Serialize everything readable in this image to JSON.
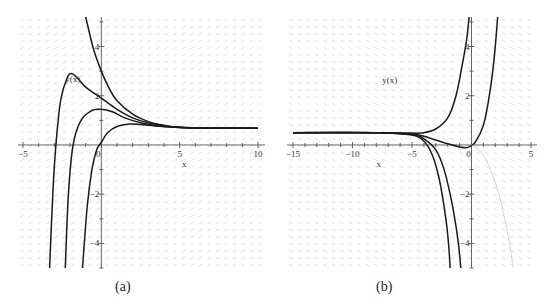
{
  "captions": {
    "a": "(a)",
    "b": "(b)"
  },
  "colors": {
    "curve": "#1a1a1a",
    "axis": "#555555",
    "field": "#d9d9d9",
    "faint_curve": "#c8c8c8"
  },
  "chart_data": [
    {
      "type": "line",
      "title": "",
      "panel": "(a)",
      "xlabel": "x",
      "ylabel": "y(x)",
      "xlim": [
        -5.5,
        10.5
      ],
      "ylim": [
        -5,
        5.2
      ],
      "xticks": [
        -5,
        0,
        5,
        10
      ],
      "xtick_labels": [
        "−5",
        "0",
        "5",
        "10"
      ],
      "yticks": [
        -4,
        -2,
        2,
        4
      ],
      "ytick_labels": [
        "−4",
        "−2",
        "2",
        "4"
      ],
      "grid": false,
      "background": "direction field",
      "series": [
        {
          "name": "solution 1",
          "points": [
            [
              -1.0,
              5.2
            ],
            [
              -0.5,
              3.9
            ],
            [
              0,
              3.0
            ],
            [
              0.5,
              2.3
            ],
            [
              1,
              1.8
            ],
            [
              2,
              1.25
            ],
            [
              3,
              0.95
            ],
            [
              4,
              0.8
            ],
            [
              5,
              0.72
            ],
            [
              7,
              0.69
            ],
            [
              10,
              0.68
            ]
          ]
        },
        {
          "name": "solution 2",
          "points": [
            [
              -3.3,
              -5
            ],
            [
              -3.1,
              -2
            ],
            [
              -2.9,
              0
            ],
            [
              -2.6,
              1.8
            ],
            [
              -2.2,
              2.7
            ],
            [
              -1.9,
              2.9
            ],
            [
              -1.5,
              2.7
            ],
            [
              -1,
              2.35
            ],
            [
              0,
              1.9
            ],
            [
              1,
              1.45
            ],
            [
              2,
              1.1
            ],
            [
              3,
              0.9
            ],
            [
              4,
              0.78
            ],
            [
              5,
              0.72
            ],
            [
              7,
              0.69
            ],
            [
              10,
              0.68
            ]
          ]
        },
        {
          "name": "solution 3",
          "points": [
            [
              -2.3,
              -5
            ],
            [
              -2.1,
              -2
            ],
            [
              -1.8,
              0
            ],
            [
              -1.3,
              1.0
            ],
            [
              -0.6,
              1.4
            ],
            [
              0,
              1.45
            ],
            [
              0.7,
              1.35
            ],
            [
              1.5,
              1.1
            ],
            [
              2.5,
              0.9
            ],
            [
              3.5,
              0.78
            ],
            [
              5,
              0.71
            ],
            [
              7,
              0.69
            ],
            [
              10,
              0.68
            ]
          ]
        },
        {
          "name": "solution 4",
          "points": [
            [
              -1.2,
              -5
            ],
            [
              -0.9,
              -2.5
            ],
            [
              -0.6,
              -1
            ],
            [
              -0.3,
              -0.2
            ],
            [
              0,
              0.1
            ],
            [
              0.4,
              0.5
            ],
            [
              1,
              0.75
            ],
            [
              1.8,
              0.85
            ],
            [
              2.5,
              0.83
            ],
            [
              3.5,
              0.77
            ],
            [
              5,
              0.71
            ],
            [
              7,
              0.69
            ],
            [
              10,
              0.68
            ]
          ]
        }
      ],
      "annotations": [
        {
          "text": "y(x)",
          "x": -2.3,
          "y": 2.55
        }
      ]
    },
    {
      "type": "line",
      "title": "",
      "panel": "(b)",
      "xlabel": "x",
      "ylabel": "y(x)",
      "xlim": [
        -15.5,
        5.5
      ],
      "ylim": [
        -5,
        5.2
      ],
      "xticks": [
        -15,
        -10,
        -5,
        0,
        5
      ],
      "xtick_labels": [
        "−15",
        "−10",
        "−5",
        "0",
        "5"
      ],
      "yticks": [
        -4,
        -2,
        2,
        4
      ],
      "ytick_labels": [
        "−4",
        "−2",
        "2",
        "4"
      ],
      "grid": false,
      "background": "direction field",
      "series": [
        {
          "name": "solution 1",
          "points": [
            [
              -15,
              0.5
            ],
            [
              -8,
              0.5
            ],
            [
              -5,
              0.48
            ],
            [
              -4,
              0.5
            ],
            [
              -3,
              0.65
            ],
            [
              -2,
              1.1
            ],
            [
              -1.3,
              2.0
            ],
            [
              -0.8,
              3.2
            ],
            [
              -0.4,
              4.3
            ],
            [
              -0.2,
              5.2
            ]
          ]
        },
        {
          "name": "solution 2",
          "points": [
            [
              -15,
              0.5
            ],
            [
              -8,
              0.5
            ],
            [
              -5,
              0.45
            ],
            [
              -4,
              0.35
            ],
            [
              -3,
              0.2
            ],
            [
              -2,
              0.05
            ],
            [
              -1,
              -0.08
            ],
            [
              -0.3,
              -0.1
            ],
            [
              0.3,
              0.1
            ],
            [
              1,
              0.8
            ],
            [
              1.5,
              2.0
            ],
            [
              1.9,
              3.5
            ],
            [
              2.2,
              5.2
            ]
          ]
        },
        {
          "name": "solution 3",
          "points": [
            [
              -15,
              0.5
            ],
            [
              -8,
              0.5
            ],
            [
              -5,
              0.42
            ],
            [
              -4,
              0.25
            ],
            [
              -3,
              -0.2
            ],
            [
              -2.3,
              -1
            ],
            [
              -1.8,
              -2
            ],
            [
              -1.4,
              -3
            ],
            [
              -1.1,
              -4
            ],
            [
              -0.9,
              -5
            ]
          ]
        },
        {
          "name": "solution 4",
          "points": [
            [
              -15,
              0.5
            ],
            [
              -8,
              0.5
            ],
            [
              -5,
              0.4
            ],
            [
              -4,
              0.15
            ],
            [
              -3.3,
              -0.4
            ],
            [
              -2.8,
              -1.2
            ],
            [
              -2.4,
              -2.2
            ],
            [
              -2.1,
              -3.2
            ],
            [
              -1.9,
              -4.2
            ],
            [
              -1.8,
              -5
            ]
          ]
        },
        {
          "name": "faint solution",
          "faint": true,
          "points": [
            [
              0,
              0
            ],
            [
              0.8,
              -0.3
            ],
            [
              1.6,
              -1
            ],
            [
              2.3,
              -2
            ],
            [
              2.8,
              -3
            ],
            [
              3.2,
              -4
            ],
            [
              3.5,
              -5
            ]
          ]
        }
      ],
      "annotations": [
        {
          "text": "y(x)",
          "x": -7.5,
          "y": 2.5
        }
      ]
    }
  ]
}
